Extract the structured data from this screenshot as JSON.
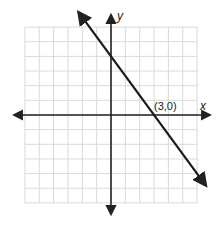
{
  "chart_data": {
    "type": "line",
    "title": "",
    "xlabel": "x",
    "ylabel": "y",
    "xlim": [
      -6,
      6
    ],
    "ylim": [
      -6,
      6
    ],
    "grid": true,
    "grid_step": 1,
    "series": [
      {
        "name": "line",
        "equation": "y = -4/3 x + 4",
        "slope": -1.3333,
        "y_intercept": 4,
        "x_intercept": 3,
        "points": [
          [
            0,
            4
          ],
          [
            3,
            0
          ]
        ],
        "arrows_both_ends": true,
        "color": "#1a1a1a"
      }
    ],
    "annotations": [
      {
        "text": "(3,0)",
        "x": 3,
        "y": 0
      }
    ]
  },
  "labels": {
    "x_axis": "x",
    "y_axis": "y",
    "point": "(3,0)"
  },
  "colors": {
    "grid": "#d9d9d9",
    "axis": "#222222",
    "line": "#1a1a1a",
    "background": "#ffffff"
  }
}
